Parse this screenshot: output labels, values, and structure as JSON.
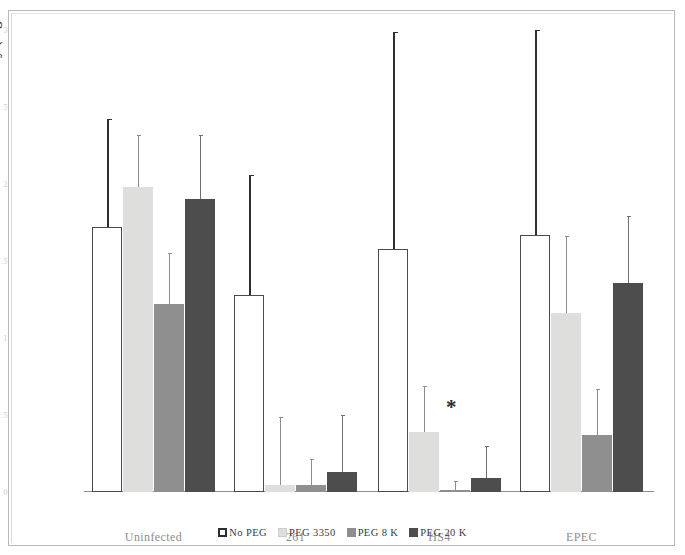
{
  "chart_data": {
    "type": "bar",
    "title": "",
    "xlabel": "",
    "ylabel": "MMP-1 Activity (mg/mL)",
    "ylim": [
      0,
      3
    ],
    "yticks": [
      "0",
      "0.5",
      "1",
      "1.5",
      "2",
      "2.5",
      "3"
    ],
    "ytick_values": [
      0,
      0.5,
      1,
      1.5,
      2,
      2.5,
      3
    ],
    "grid": false,
    "legend_position": "bottom",
    "categories": [
      "Uninfected",
      "261",
      "HS4",
      "EPEC"
    ],
    "series": [
      {
        "name": "No PEG",
        "color": "#ffffff",
        "values": [
          1.72,
          1.28,
          1.58,
          1.67
        ],
        "errors": [
          0.7,
          0.78,
          1.41,
          1.33
        ]
      },
      {
        "name": "PEG 3350",
        "color": "#dededd",
        "values": [
          1.98,
          0.045,
          0.39,
          1.16
        ],
        "errors": [
          0.34,
          0.44,
          0.3,
          0.5
        ]
      },
      {
        "name": "PEG 8 K",
        "color": "#8f8f8f",
        "values": [
          1.22,
          0.045,
          0.01,
          0.37
        ],
        "errors": [
          0.33,
          0.17,
          0.06,
          0.3
        ]
      },
      {
        "name": "PEG 20 K",
        "color": "#4d4d4d",
        "values": [
          1.9,
          0.13,
          0.09,
          1.36
        ],
        "errors": [
          0.42,
          0.37,
          0.21,
          0.43
        ]
      }
    ],
    "annotations": [
      {
        "text": "*",
        "category": "HS4",
        "note": "significance marker"
      }
    ]
  },
  "legend": {
    "items": [
      {
        "label": "No PEG",
        "icon": "square-outline-swatch"
      },
      {
        "label": "PEG 3350",
        "icon": "square-light-gray-swatch"
      },
      {
        "label": "PEG 8 K",
        "icon": "square-mid-gray-swatch"
      },
      {
        "label": "PEG 20 K",
        "icon": "square-dark-gray-swatch"
      }
    ]
  }
}
